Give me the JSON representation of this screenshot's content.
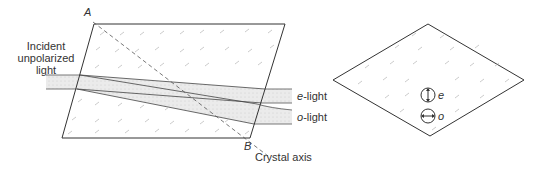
{
  "diagram": {
    "left_figure": {
      "corner_labels": {
        "top": "A",
        "bottom": "B"
      },
      "incident_label_lines": [
        "Incident",
        "unpolarized",
        "light"
      ],
      "axis_label": "Crystal axis",
      "output_beams": [
        {
          "prefix": "e",
          "suffix": "-light"
        },
        {
          "prefix": "o",
          "suffix": "-light"
        }
      ]
    },
    "right_figure": {
      "polarization_symbols": [
        {
          "label": "e",
          "orientation": "vertical"
        },
        {
          "label": "o",
          "orientation": "horizontal"
        }
      ]
    },
    "colors": {
      "line": "#333333",
      "beam_fill": "#e6e6e6",
      "texture": "#b0b0b0"
    }
  }
}
